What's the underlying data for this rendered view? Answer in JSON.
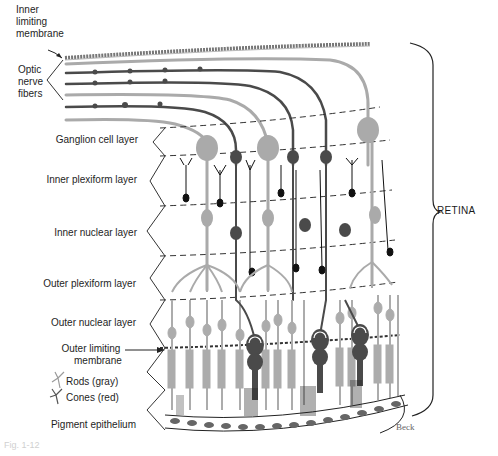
{
  "figure": {
    "bracket_label": "RETINA",
    "credit": "Beck",
    "caption": "Fig. 1-12"
  },
  "labels": {
    "inner_limiting_membrane": [
      "Inner",
      "limiting",
      "membrane"
    ],
    "optic_nerve_fibers": [
      "Optic",
      "nerve",
      "fibers"
    ],
    "ganglion_cell_layer": "Ganglion cell layer",
    "inner_plexiform_layer": "Inner plexiform layer",
    "inner_nuclear_layer": "Inner nuclear layer",
    "outer_plexiform_layer": "Outer plexiform layer",
    "outer_nuclear_layer": "Outer nuclear layer",
    "outer_limiting_membrane": [
      "Outer limiting",
      "membrane"
    ],
    "pigment_epithelium": "Pigment epithelium"
  },
  "legend": [
    {
      "label": "Rods (gray)",
      "color": "#a8a8a8",
      "icon": "rod-icon"
    },
    {
      "label": "Cones (red)",
      "color": "#555555",
      "icon": "cone-icon"
    }
  ],
  "colors": {
    "rod_gray": "#acacac",
    "cone_dark": "#4a4a4a",
    "line": "#222222",
    "dashed": "#333333"
  }
}
